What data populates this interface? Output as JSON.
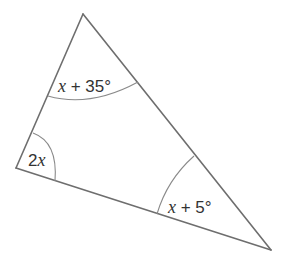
{
  "diagram": {
    "type": "triangle",
    "stroke_color": "#6e6e6e",
    "vertices": {
      "top": [
        83,
        14
      ],
      "left": [
        16,
        168
      ],
      "right": [
        271,
        250
      ]
    },
    "angles": {
      "top": {
        "variable": "x",
        "expr": " + 35°",
        "full": "x + 35°"
      },
      "left": {
        "coef": "2",
        "variable": "x",
        "full": "2x"
      },
      "right": {
        "variable": "x",
        "expr": " + 5°",
        "full": "x + 5°"
      }
    }
  }
}
